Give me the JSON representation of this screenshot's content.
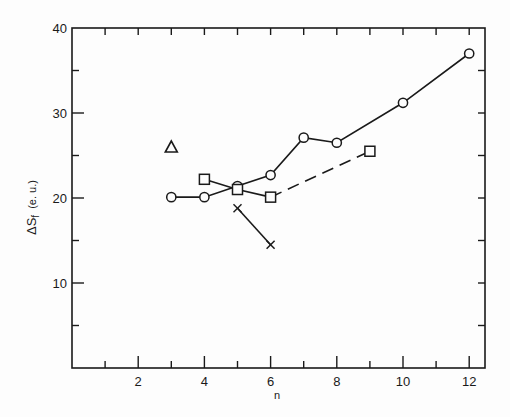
{
  "chart_data": {
    "type": "line",
    "title": "",
    "xlabel": "n",
    "ylabel": "ΔSf (e.u.)",
    "ylabel_main": "ΔS",
    "ylabel_sub": "f",
    "ylabel_units": "(e. u.)",
    "xlim": [
      0,
      12.5
    ],
    "ylim": [
      0,
      40
    ],
    "x_ticks_major": [
      2,
      4,
      6,
      8,
      10,
      12
    ],
    "x_tick_labels": [
      "2",
      "4",
      "6",
      "8",
      "10",
      "12"
    ],
    "x_ticks_minor": [
      1,
      3,
      5,
      7,
      9,
      11
    ],
    "y_ticks_major": [
      10,
      20,
      30,
      40
    ],
    "y_tick_labels": [
      "10",
      "20",
      "30",
      "40"
    ],
    "y_ticks_minor": [
      5,
      15,
      25,
      35
    ],
    "grid": false,
    "legend": null,
    "series": [
      {
        "name": "circles",
        "marker": "circle",
        "line": "solid",
        "x": [
          3,
          4,
          5,
          6,
          7,
          8,
          10,
          12
        ],
        "y": [
          20.1,
          20.1,
          21.4,
          22.7,
          27.1,
          26.5,
          31.2,
          37.0
        ]
      },
      {
        "name": "squares",
        "marker": "square",
        "line": "segmented",
        "segments": [
          {
            "x": [
              4,
              5,
              6
            ],
            "y": [
              22.2,
              21.0,
              20.1
            ],
            "line": "solid"
          },
          {
            "x": [
              6,
              9
            ],
            "y": [
              20.1,
              25.5
            ],
            "line": "dashed"
          }
        ],
        "x": [
          4,
          5,
          6,
          9
        ],
        "y": [
          22.2,
          21.0,
          20.1,
          25.5
        ]
      },
      {
        "name": "crosses",
        "marker": "x",
        "line": "solid",
        "x": [
          5,
          6
        ],
        "y": [
          18.8,
          14.5
        ]
      },
      {
        "name": "triangle",
        "marker": "triangle",
        "line": "none",
        "x": [
          3
        ],
        "y": [
          26.0
        ]
      }
    ]
  },
  "colors": {
    "ink": "#1a1a1a",
    "background": "#fdfdfd"
  }
}
